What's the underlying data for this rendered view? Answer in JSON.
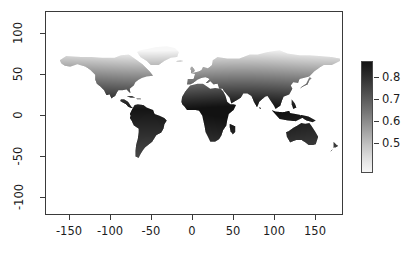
{
  "chart_data": {
    "type": "heatmap",
    "title": "",
    "subtitle": "",
    "xlabel": "",
    "ylabel": "",
    "xlim": [
      -185,
      185
    ],
    "ylim": [
      -125,
      125
    ],
    "grid": false,
    "projection": "equirectangular",
    "x_ticks": [
      -150,
      -100,
      -50,
      0,
      50,
      100,
      150
    ],
    "x_tick_labels": [
      "-150",
      "-100",
      "-50",
      "0",
      "50",
      "100",
      "150"
    ],
    "y_ticks": [
      -100,
      -50,
      0,
      50,
      100
    ],
    "y_tick_labels": [
      "-100",
      "-50",
      "0",
      "50",
      "100"
    ],
    "colorbar": {
      "position": "right",
      "orientation": "vertical",
      "vmin": 0.45,
      "vmax": 0.88,
      "ticks": [
        0.8,
        0.7,
        0.6,
        0.5
      ],
      "tick_labels": [
        "0.8",
        "0.7",
        "0.6",
        "0.5"
      ],
      "low_color": "#f6f6f6",
      "high_color": "#141414",
      "reversed": true
    },
    "region_values": [
      {
        "region": "South America",
        "value": 0.88
      },
      {
        "region": "Central Africa",
        "value": 0.87
      },
      {
        "region": "Southern Africa",
        "value": 0.85
      },
      {
        "region": "Central America",
        "value": 0.84
      },
      {
        "region": "Southeast Asia",
        "value": 0.82
      },
      {
        "region": "India",
        "value": 0.78
      },
      {
        "region": "North Africa",
        "value": 0.78
      },
      {
        "region": "Australia",
        "value": 0.72
      },
      {
        "region": "Southern USA",
        "value": 0.7
      },
      {
        "region": "Southern Europe",
        "value": 0.68
      },
      {
        "region": "Central Asia",
        "value": 0.64
      },
      {
        "region": "Northern Europe",
        "value": 0.55
      },
      {
        "region": "Canada",
        "value": 0.52
      },
      {
        "region": "Siberia",
        "value": 0.5
      },
      {
        "region": "Greenland",
        "value": 0.47
      }
    ]
  },
  "axes": {
    "x_tick_labels": [
      "-150",
      "-100",
      "-50",
      "0",
      "50",
      "100",
      "150"
    ],
    "y_tick_labels": [
      "-100",
      "-50",
      "0",
      "50",
      "100"
    ]
  },
  "legend": {
    "labels": [
      "0.8",
      "0.7",
      "0.6",
      "0.5"
    ]
  }
}
